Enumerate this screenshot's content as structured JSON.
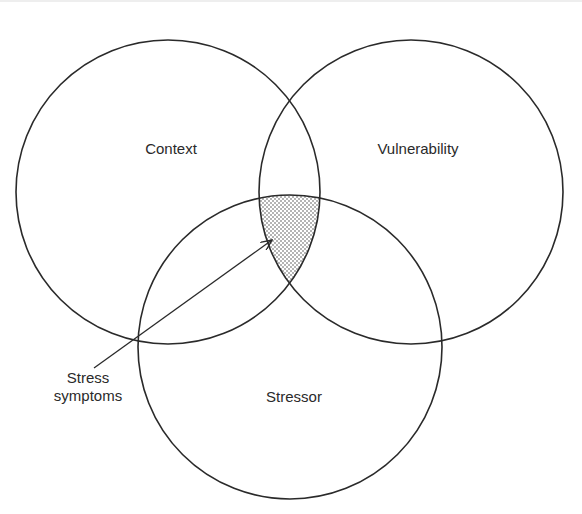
{
  "diagram": {
    "type": "venn",
    "circles": [
      {
        "id": "context",
        "label": "Context",
        "cx": 168,
        "cy": 192,
        "r": 152
      },
      {
        "id": "vulnerability",
        "label": "Vulnerability",
        "cx": 411,
        "cy": 192,
        "r": 152
      },
      {
        "id": "stressor",
        "label": "Stressor",
        "cx": 290,
        "cy": 347,
        "r": 152
      }
    ],
    "intersection": {
      "label_line1": "Stress",
      "label_line2": "symptoms",
      "description": "Shaded triple intersection of Context, Vulnerability and Stressor"
    },
    "colors": {
      "stroke": "#2a2a2a",
      "shade_dot": "#555555",
      "background": "#ffffff"
    }
  }
}
